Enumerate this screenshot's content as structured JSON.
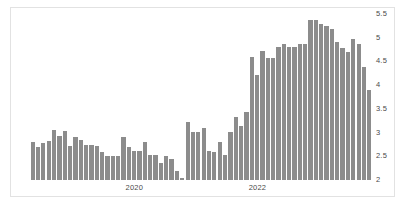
{
  "chart_data": {
    "type": "bar",
    "title": "",
    "subtitle": "",
    "xlabel": "",
    "ylabel": "",
    "ylim": [
      2,
      5.5
    ],
    "yticks": [
      "2",
      "2.5",
      "3",
      "3.5",
      "4",
      "4.5",
      "5",
      "5.5"
    ],
    "ytick_values": [
      2,
      2.5,
      3,
      3.5,
      4,
      4.5,
      5,
      5.5
    ],
    "xticks": [
      "2020",
      "2022"
    ],
    "xtick_positions": [
      0.305,
      0.665
    ],
    "grid": false,
    "legend": null,
    "bar_color": "#8c8c8c",
    "background": "#ffffff",
    "border_color": "#e2e2e2",
    "categories": [
      "2019-01",
      "2019-02",
      "2019-03",
      "2019-04",
      "2019-05",
      "2019-06",
      "2019-07",
      "2019-08",
      "2019-09",
      "2019-10",
      "2019-11",
      "2019-12",
      "2020-01",
      "2020-02",
      "2020-03",
      "2020-04",
      "2020-05",
      "2020-06",
      "2020-07",
      "2020-08",
      "2020-09",
      "2020-10",
      "2020-11",
      "2020-12",
      "2021-01",
      "2021-02",
      "2021-03",
      "2021-04",
      "2021-05",
      "2021-06",
      "2021-07",
      "2021-08",
      "2021-09",
      "2021-10",
      "2021-11",
      "2021-12",
      "2022-01",
      "2022-02",
      "2022-03",
      "2022-04",
      "2022-05",
      "2022-06",
      "2022-07",
      "2022-08",
      "2022-09",
      "2022-10",
      "2022-11",
      "2022-12",
      "2023-01",
      "2023-02",
      "2023-03",
      "2023-04",
      "2023-05",
      "2023-06",
      "2023-07",
      "2023-08",
      "2023-09",
      "2023-10",
      "2023-11",
      "2023-12",
      "2024-01",
      "2024-02",
      "2024-03",
      "2024-04"
    ],
    "values": [
      2.8,
      2.7,
      2.78,
      2.82,
      3.05,
      2.93,
      3.04,
      2.72,
      2.9,
      2.84,
      2.73,
      2.73,
      2.72,
      2.6,
      2.5,
      2.51,
      2.5,
      2.9,
      2.7,
      2.62,
      2.62,
      2.8,
      2.52,
      2.52,
      2.36,
      2.5,
      2.44,
      2.18,
      2.05,
      3.22,
      3.02,
      3.01,
      3.1,
      2.62,
      2.6,
      2.8,
      2.52,
      3.02,
      3.32,
      3.14,
      3.44,
      4.6,
      4.22,
      4.72,
      4.58,
      4.58,
      4.8,
      4.86,
      4.8,
      4.8,
      4.86,
      4.86,
      5.38,
      5.38,
      5.3,
      5.24,
      5.18,
      4.9,
      4.78,
      4.7,
      4.98,
      4.86,
      4.38,
      3.9
    ]
  }
}
